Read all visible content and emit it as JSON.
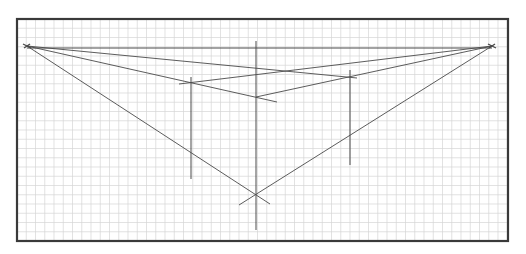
{
  "diagram": {
    "canvas": {
      "width": 526,
      "height": 254,
      "background": "#ffffff"
    },
    "frame": {
      "x": 17,
      "y": 19,
      "width": 491,
      "height": 222,
      "stroke": "#3a3a3a",
      "stroke_width": 2.2
    },
    "grid": {
      "spacing": 9.25,
      "color": "#d6d6d6",
      "stroke_width": 0.7
    },
    "line_color": "#4a4a4a",
    "vanishing_points": {
      "left": {
        "x": 27,
        "y": 46
      },
      "right": {
        "x": 492,
        "y": 46
      }
    },
    "horizon_line": {
      "x1": 27,
      "y1": 48,
      "x2": 492,
      "y2": 48
    },
    "verticals": [
      {
        "name": "center-edge",
        "x": 256,
        "y1": 41,
        "y2": 230
      },
      {
        "name": "left-edge",
        "x": 191,
        "y1": 77,
        "y2": 179
      },
      {
        "name": "right-edge",
        "x": 350,
        "y1": 70,
        "y2": 165
      }
    ],
    "key_points": {
      "top_center": {
        "x": 256,
        "y": 97
      },
      "bottom_center": {
        "x": 256,
        "y": 194
      },
      "top_left": {
        "x": 191,
        "y": 83
      },
      "top_right": {
        "x": 350,
        "y": 77
      }
    },
    "construction_lines": [
      {
        "name": "left-vp-to-right-top",
        "x1": 27,
        "y1": 46,
        "x2": 357,
        "y2": 78
      },
      {
        "name": "left-vp-to-top-center",
        "x1": 27,
        "y1": 46,
        "x2": 277,
        "y2": 102
      },
      {
        "name": "left-vp-to-bottom-center",
        "x1": 27,
        "y1": 46,
        "x2": 270,
        "y2": 204
      },
      {
        "name": "right-vp-to-left-top",
        "x1": 492,
        "y1": 46,
        "x2": 179,
        "y2": 84
      },
      {
        "name": "right-vp-to-top-center",
        "x1": 492,
        "y1": 46,
        "x2": 256,
        "y2": 97
      },
      {
        "name": "right-vp-to-bottom-center",
        "x1": 492,
        "y1": 46,
        "x2": 239,
        "y2": 205
      }
    ]
  }
}
